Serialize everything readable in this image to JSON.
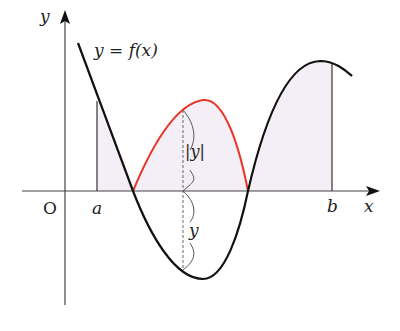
{
  "labels": {
    "y_axis": "y",
    "x_axis": "x",
    "origin": "O",
    "a": "a",
    "b": "b",
    "function": "y = f(x)",
    "abs_y": "|y|",
    "y_segment": "y"
  },
  "colors": {
    "curve": "#111111",
    "reflected_curve": "#e8362a",
    "axis": "#333333",
    "shade": "#f4eef6",
    "dashed": "#666666"
  }
}
